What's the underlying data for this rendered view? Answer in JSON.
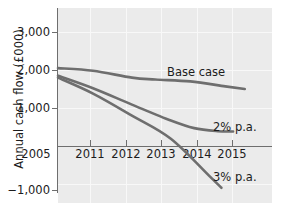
{
  "chart_data": {
    "type": "line",
    "title": "",
    "xlabel": "",
    "ylabel": "Annual cash flow (£000)",
    "x_tick_labels": [
      "2005",
      "2011",
      "2012",
      "2013",
      "2014",
      "2015"
    ],
    "y_tick_labels": [
      "3,000",
      "2,000",
      "1,000",
      "−1,000"
    ],
    "ylim": [
      -1400,
      3300
    ],
    "xlim": [
      2010.1,
      2015.6
    ],
    "grid": true,
    "legend_position": "inline-right",
    "series": [
      {
        "name": "Base case",
        "label": "Base case",
        "color": "#6e6e6e",
        "x": [
          2010.1,
          2011.0,
          2012.0,
          2012.6,
          2013.5,
          2014.4,
          2014.9
        ],
        "values": [
          2050,
          1980,
          1800,
          1750,
          1700,
          1570,
          1500
        ]
      },
      {
        "name": "2% p.a.",
        "label": "2% p.a.",
        "color": "#6e6e6e",
        "x": [
          2010.1,
          2011.0,
          2012.0,
          2013.0,
          2013.6,
          2014.2,
          2014.6
        ],
        "values": [
          1850,
          1520,
          1090,
          670,
          470,
          390,
          380
        ]
      },
      {
        "name": "3% p.a.",
        "label": "3% p.a.",
        "color": "#6e6e6e",
        "x": [
          2010.1,
          2011.0,
          2012.0,
          2013.0,
          2014.0,
          2014.3
        ],
        "values": [
          1800,
          1380,
          800,
          190,
          -800,
          -1100
        ]
      }
    ]
  },
  "axis": {
    "y_title": "Annual cash flow (£000)",
    "y_ticks": [
      {
        "label": "3,000",
        "top": 26
      },
      {
        "label": "2,000",
        "top": 64
      },
      {
        "label": "1,000",
        "top": 102
      },
      {
        "label": "−1,000",
        "top": 184
      }
    ],
    "x_ticks": [
      {
        "label": "2005",
        "left": 14
      },
      {
        "label": "2011",
        "left": 68
      },
      {
        "label": "2012",
        "left": 104
      },
      {
        "label": "2013",
        "left": 139
      },
      {
        "label": "2014",
        "left": 175
      },
      {
        "label": "2015",
        "left": 210
      }
    ]
  },
  "series_labels": {
    "base": "Base case",
    "two_pct": "2% p.a.",
    "three_pct": "3% p.a."
  },
  "colors": {
    "line": "#6e6e6e",
    "plot_background": "#ebebeb",
    "grid": "#f8f8f8",
    "axis": "#6e6e6e",
    "text": "#1c1c1c"
  }
}
